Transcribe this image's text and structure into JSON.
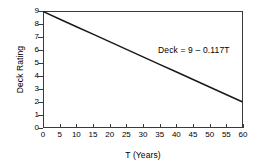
{
  "chart_data": {
    "type": "line",
    "title": "",
    "subtitle": "",
    "xlabel": "T (Years)",
    "ylabel": "Deck Rating",
    "xlim": [
      0,
      60
    ],
    "ylim": [
      0,
      9
    ],
    "xticks": [
      0,
      5,
      10,
      15,
      20,
      25,
      30,
      35,
      40,
      45,
      50,
      55,
      60
    ],
    "yticks": [
      0,
      1,
      2,
      3,
      4,
      5,
      6,
      7,
      8,
      9
    ],
    "xticklabels": [
      "0",
      "5",
      "10",
      "15",
      "20",
      "25",
      "30",
      "35",
      "40",
      "45",
      "50",
      "55",
      "60"
    ],
    "yticklabels": [
      "0",
      "1",
      "2",
      "3",
      "4",
      "5",
      "6",
      "7",
      "8",
      "9"
    ],
    "grid": false,
    "legend": null,
    "annotations": [
      {
        "text": "Deck = 9 – 0.117T",
        "x": 35,
        "y": 6.3
      }
    ],
    "series": [
      {
        "name": "Deck Rating vs Time",
        "equation": "Deck = 9 - 0.117T",
        "intercept": 9,
        "slope": -0.117,
        "color": "#1a1a1a",
        "linewidth": 1.5,
        "x": [
          0,
          5,
          10,
          15,
          20,
          25,
          30,
          35,
          40,
          45,
          50,
          55,
          60
        ],
        "values": [
          9.0,
          8.415,
          7.83,
          7.245,
          6.66,
          6.075,
          5.49,
          4.905,
          4.32,
          3.735,
          3.15,
          2.565,
          1.98
        ]
      }
    ]
  },
  "style": {
    "background": "#ffffff",
    "frame_color": "#3a3a3a",
    "text_color": "#000000",
    "line_color": "#1a1a1a"
  }
}
